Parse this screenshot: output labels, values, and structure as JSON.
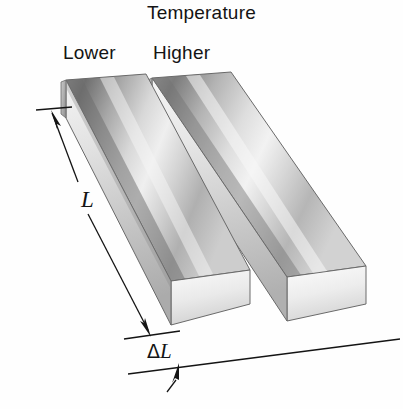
{
  "figure": {
    "kind": "thermal-expansion-diagram",
    "background_color": "#fefefe",
    "title": "Temperature",
    "labels": {
      "lower": "Lower",
      "higher": "Higher",
      "length": "L",
      "delta_symbol": "Δ",
      "delta_length": "L"
    },
    "bars": [
      {
        "name": "lower-temperature-bar",
        "position": "left",
        "temperature_label": "Lower",
        "fill_light": "#fbfbfb",
        "fill_mid": "#b9b9b9",
        "fill_dark": "#6f6f6f",
        "edge_color": "#5a5a5a"
      },
      {
        "name": "higher-temperature-bar",
        "position": "right",
        "temperature_label": "Higher",
        "fill_light": "#fcfcfc",
        "fill_mid": "#c2c2c2",
        "fill_dark": "#767676",
        "edge_color": "#5a5a5a"
      }
    ],
    "annotations": [
      {
        "name": "length-dimension",
        "symbol": "L",
        "meaning": "original length of bar",
        "line_color": "#141414"
      },
      {
        "name": "delta-length-dimension",
        "symbol": "ΔL",
        "meaning": "increase in length due to heating",
        "line_color": "#141414"
      }
    ]
  }
}
